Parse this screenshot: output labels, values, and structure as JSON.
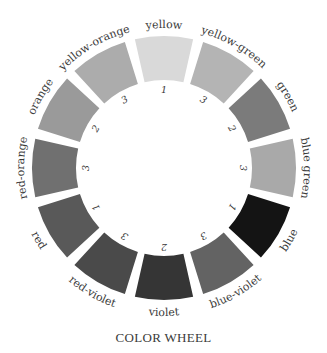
{
  "title": "COLOR WHEEL",
  "geometry": {
    "cx": 164,
    "cy": 168,
    "r_outer": 132,
    "r_inner": 88,
    "r_label": 140,
    "r_number": 78,
    "gap_deg": 4.5
  },
  "segments": [
    {
      "name": "yellow",
      "number": "1",
      "fill": "#d9d9d9"
    },
    {
      "name": "yellow-green",
      "number": "3",
      "fill": "#b4b4b4"
    },
    {
      "name": "green",
      "number": "2",
      "fill": "#7b7b7b"
    },
    {
      "name": "blue green",
      "number": "3",
      "fill": "#a9a9a9"
    },
    {
      "name": "blue",
      "number": "1",
      "fill": "#141414"
    },
    {
      "name": "blue-violet",
      "number": "3",
      "fill": "#636363"
    },
    {
      "name": "violet",
      "number": "2",
      "fill": "#353535"
    },
    {
      "name": "red-violet",
      "number": "3",
      "fill": "#4a4a4a"
    },
    {
      "name": "red",
      "number": "1",
      "fill": "#595959"
    },
    {
      "name": "red-orange",
      "number": "3",
      "fill": "#707070"
    },
    {
      "name": "orange",
      "number": "2",
      "fill": "#9a9a9a"
    },
    {
      "name": "yellow-orange",
      "number": "3",
      "fill": "#acacac"
    }
  ]
}
